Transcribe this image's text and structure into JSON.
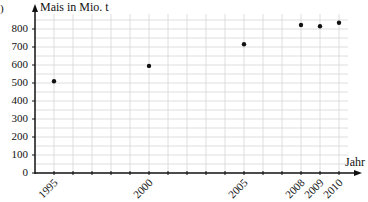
{
  "chart_data": {
    "type": "scatter",
    "title": "",
    "ylabel": "Mais in Mio. t",
    "xlabel": "Jahr",
    "x": [
      1995,
      2000,
      2005,
      2008,
      2009,
      2010
    ],
    "values": [
      510,
      595,
      715,
      822,
      815,
      835
    ],
    "series": [
      {
        "name": "Mais",
        "x": [
          1995,
          2000,
          2005,
          2008,
          2009,
          2010
        ],
        "values": [
          510,
          595,
          715,
          822,
          815,
          835
        ]
      }
    ],
    "xlim": [
      1994,
      2011
    ],
    "ylim": [
      0,
      850
    ],
    "yticks": [
      0,
      100,
      200,
      300,
      400,
      500,
      600,
      700,
      800
    ],
    "xtick_labels": [
      "1995",
      "2000",
      "2005",
      "2008",
      "2009",
      "2010"
    ],
    "grid": true,
    "legend": null
  },
  "panel_marker": ")",
  "colors": {
    "grid": "#d6d6d6",
    "axis": "#111111",
    "point": "#111111"
  }
}
